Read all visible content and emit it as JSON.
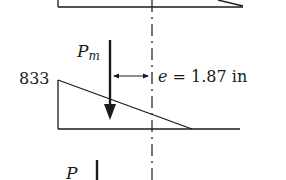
{
  "diagram": {
    "type": "eccentric load / stress distribution diagram",
    "labels": {
      "stress_value": "833",
      "load_symbol": "P",
      "load_subscript": "m",
      "eccentricity_symbol": "e",
      "eccentricity_text": " = 1.87 in",
      "bottom_load_symbol": "P"
    },
    "colors": {
      "line": "#1a1a1a",
      "background": "#ffffff"
    }
  }
}
